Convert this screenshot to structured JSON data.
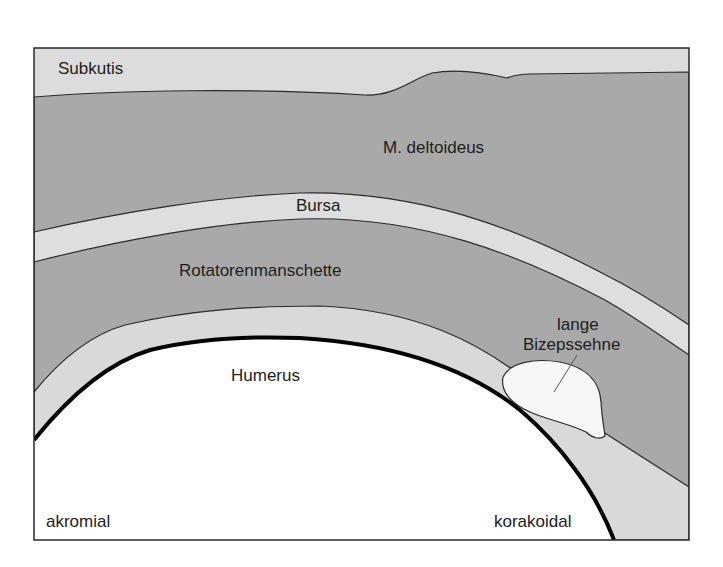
{
  "diagram": {
    "title": "",
    "colors": {
      "background": "#ffffff",
      "subkutis": "#dcdcdc",
      "muscle": "#a9a9a9",
      "bursa": "#dedede",
      "tendon_layer": "#d9d9d9",
      "humerus": "#ffffff",
      "biceps_tendon": "#f7f7f7",
      "outline": "#2a2a2a",
      "bone_contour": "#000000"
    },
    "labels": {
      "subkutis": "Subkutis",
      "deltoid": "M. deltoideus",
      "bursa": "Bursa",
      "rotator_cuff": "Rotatorenmanschette",
      "biceps_line1": "lange",
      "biceps_line2": "Bizepssehne",
      "humerus": "Humerus",
      "acromial": "akromial",
      "coracoid": "korakoidal"
    }
  }
}
